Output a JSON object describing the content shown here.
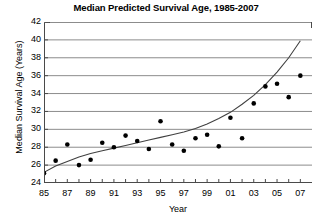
{
  "chart_data": {
    "type": "scatter",
    "title": "Median Predicted Survival Age, 1985-2007",
    "xlabel": "Year",
    "ylabel": "Median Survival Age (Years)",
    "xlim": [
      1985,
      2008
    ],
    "ylim": [
      24,
      42
    ],
    "ytick_step": 2,
    "xtick_step": 1,
    "grid": "horizontal",
    "legend": "none",
    "y_ticks": [
      24,
      26,
      28,
      30,
      32,
      34,
      36,
      38,
      40,
      42
    ],
    "x_ticks": [
      1985,
      1986,
      1987,
      1988,
      1989,
      1990,
      1991,
      1992,
      1993,
      1994,
      1995,
      1996,
      1997,
      1998,
      1999,
      2000,
      2001,
      2002,
      2003,
      2004,
      2005,
      2006,
      2007
    ],
    "x_tick_labels": [
      "85",
      "",
      "87",
      "",
      "89",
      "",
      "91",
      "",
      "93",
      "",
      "95",
      "",
      "97",
      "",
      "99",
      "",
      "01",
      "",
      "03",
      "",
      "05",
      "",
      "07"
    ],
    "series": [
      {
        "name": "Median predicted survival age",
        "marker": "filled-circle",
        "color": "#000000",
        "x": [
          1985,
          1986,
          1987,
          1988,
          1989,
          1990,
          1991,
          1992,
          1993,
          1994,
          1995,
          1996,
          1997,
          1998,
          1999,
          2000,
          2001,
          2002,
          2003,
          2004,
          2005,
          2006,
          2007
        ],
        "y": [
          25.1,
          26.5,
          28.3,
          26.0,
          26.6,
          28.5,
          28.0,
          29.3,
          28.7,
          27.8,
          30.9,
          28.3,
          27.6,
          29.0,
          29.4,
          28.1,
          31.3,
          29.0,
          32.9,
          34.8,
          35.1,
          33.6,
          36.0
        ]
      },
      {
        "name": "Fitted trend curve",
        "type": "line",
        "color": "#3a3a3a",
        "x": [
          1985,
          1986,
          1987,
          1988,
          1989,
          1990,
          1991,
          1992,
          1993,
          1994,
          1995,
          1996,
          1997,
          1998,
          1999,
          2000,
          2001,
          2002,
          2003,
          2004,
          2005,
          2006,
          2007
        ],
        "y": [
          25.2,
          25.9,
          26.4,
          26.9,
          27.3,
          27.6,
          27.9,
          28.2,
          28.5,
          28.8,
          29.1,
          29.4,
          29.7,
          30.1,
          30.6,
          31.2,
          31.9,
          32.8,
          33.8,
          35.0,
          36.4,
          38.0,
          39.9
        ]
      }
    ]
  }
}
